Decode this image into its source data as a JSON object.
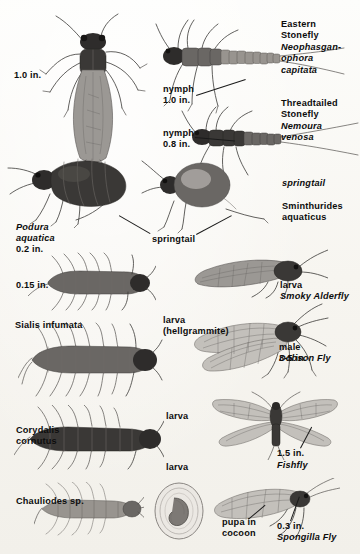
{
  "plate": {
    "title": "Aquatic insects identification plate",
    "background_color": "#fbfaf7",
    "ink_color": "#1a1a1a",
    "width": 360,
    "height": 554
  },
  "captions": [
    {
      "id": "adult-stonefly-size",
      "text": "1.0 in.",
      "style": "roman"
    },
    {
      "id": "eastern-stonefly",
      "text": "Eastern\nStonefly",
      "style": "roman"
    },
    {
      "id": "eastern-stonefly-sci",
      "text": "Neophasgan-\nophora\ncapitata",
      "style": "italic"
    },
    {
      "id": "nymph-1",
      "text": "nymph\n1.0 in.",
      "style": "roman"
    },
    {
      "id": "threadtailed-stonefly",
      "text": "Threadtailed\nStonefly",
      "style": "roman"
    },
    {
      "id": "threadtailed-stonefly-sci",
      "text": "Nemoura\nvenosa",
      "style": "italic"
    },
    {
      "id": "nymph-2",
      "text": "nymph\n0.8 in.",
      "style": "roman"
    },
    {
      "id": "podura-sci",
      "text": "Podura\naquatica",
      "style": "italic"
    },
    {
      "id": "podura-size",
      "text": "0.2 in.",
      "style": "roman"
    },
    {
      "id": "springtail",
      "text": "springtail",
      "style": "roman"
    },
    {
      "id": "sminthurides-sci",
      "text": "Sminthurides\naquaticus",
      "style": "italic"
    },
    {
      "id": "sminthurides-size",
      "text": "0.15 in.",
      "style": "roman"
    },
    {
      "id": "alderfly-larva",
      "text": "larva",
      "style": "roman"
    },
    {
      "id": "smoky-alderfly",
      "text": "Smoky Alderfly",
      "style": "roman"
    },
    {
      "id": "smoky-alderfly-sci",
      "text": "Sialis infumata",
      "style": "italic"
    },
    {
      "id": "hellgrammite-larva",
      "text": "larva\n(hellgrammite)",
      "style": "roman"
    },
    {
      "id": "dobsonfly-male-size",
      "text": "male\n3-5 in.",
      "style": "roman"
    },
    {
      "id": "dobson-fly",
      "text": "Dobson Fly",
      "style": "roman"
    },
    {
      "id": "dobson-fly-sci",
      "text": "Corydalis\ncornutus",
      "style": "italic"
    },
    {
      "id": "fishfly-larva",
      "text": "larva",
      "style": "roman"
    },
    {
      "id": "fishfly-larva-size",
      "text": "1.5 in.",
      "style": "roman"
    },
    {
      "id": "fishfly",
      "text": "Fishfly",
      "style": "roman"
    },
    {
      "id": "fishfly-sci",
      "text": "Chauliodes sp.",
      "style": "italic"
    },
    {
      "id": "spongillafly-larva",
      "text": "larva",
      "style": "roman"
    },
    {
      "id": "pupa-in-cocoon",
      "text": "pupa in\ncocoon",
      "style": "roman"
    },
    {
      "id": "spongillafly-size",
      "text": "0.3 in.",
      "style": "roman"
    },
    {
      "id": "spongilla-fly",
      "text": "Spongilla Fly",
      "style": "roman"
    },
    {
      "id": "spongilla-fly-sci",
      "text": "Sisyra vicaria",
      "style": "italic"
    }
  ],
  "figures": [
    {
      "id": "adult-stonefly",
      "label": "Eastern Stonefly adult, wings folded"
    },
    {
      "id": "stonefly-nymph-1",
      "label": "Eastern Stonefly nymph"
    },
    {
      "id": "stonefly-nymph-2",
      "label": "Threadtailed Stonefly nymph"
    },
    {
      "id": "podura-springtail",
      "label": "Podura aquatica springtail"
    },
    {
      "id": "sminthurides-springtail",
      "label": "Sminthurides aquaticus springtail"
    },
    {
      "id": "alderfly-larva-figure",
      "label": "Alderfly larva"
    },
    {
      "id": "smoky-alderfly-adult",
      "label": "Smoky Alderfly adult"
    },
    {
      "id": "hellgrammite-figure",
      "label": "Hellgrammite larva"
    },
    {
      "id": "dobsonfly-adult",
      "label": "Dobson Fly male adult"
    },
    {
      "id": "fishfly-larva-figure",
      "label": "Fishfly larva"
    },
    {
      "id": "fishfly-adult",
      "label": "Fishfly adult, wings spread"
    },
    {
      "id": "spongillafly-larva-figure",
      "label": "Spongilla Fly larva"
    },
    {
      "id": "cocoon-figure",
      "label": "Pupa in cocoon"
    },
    {
      "id": "spongillafly-adult",
      "label": "Spongilla Fly adult"
    }
  ]
}
